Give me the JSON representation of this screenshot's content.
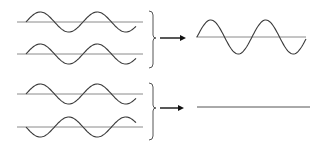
{
  "diagram": {
    "panels": [
      {
        "name": "constructive-interference",
        "inputs": [
          {
            "label": "wave-1",
            "phase": "in-phase",
            "amplitude": "A"
          },
          {
            "label": "wave-2",
            "phase": "in-phase",
            "amplitude": "A"
          }
        ],
        "result": {
          "label": "resultant-wave",
          "amplitude": "2A"
        }
      },
      {
        "name": "destructive-interference",
        "inputs": [
          {
            "label": "wave-1",
            "phase": "0"
          },
          {
            "label": "wave-2",
            "phase": "180 degrees (inverted)"
          }
        ],
        "result": {
          "label": "flat-line",
          "amplitude": "0"
        }
      }
    ],
    "colors": {
      "wave": "#3a3a3a",
      "axis": "#8a8a8a",
      "brace": "#555555",
      "arrow": "#111111",
      "background": "#ffffff"
    }
  }
}
